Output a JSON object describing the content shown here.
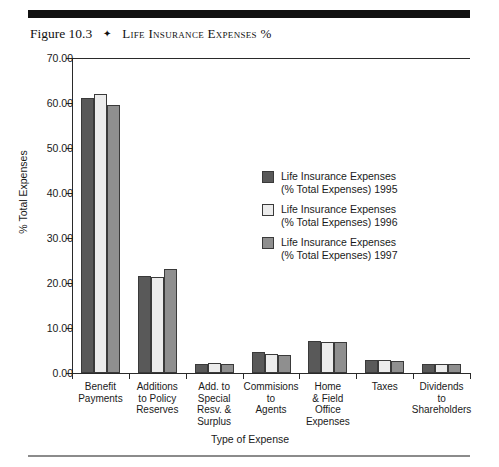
{
  "caption": {
    "figure_number": "Figure 10.3",
    "separator": "✦",
    "title": "Life Insurance Expenses %"
  },
  "colors": {
    "series_1995": "#595959",
    "series_1996": "#ececec",
    "series_1997": "#8f8f8f",
    "axis": "#2a2a2a",
    "rule_top": "#111111",
    "rule_bottom": "#8b8b8b"
  },
  "axis_title_x": "Type of Expense",
  "axis_title_y": "% Total Expenses",
  "y_tick_labels": [
    "70.00",
    "60.00",
    "50.00",
    "40.00",
    "30.00",
    "20.00",
    "10.00",
    "0.00"
  ],
  "legend": {
    "entries": [
      "Life Insurance Expenses\n(% Total Expenses) 1995",
      "Life Insurance Expenses\n(% Total Expenses) 1996",
      "Life Insurance Expenses\n(% Total Expenses) 1997"
    ]
  },
  "category_labels": [
    "Benefit\nPayments",
    "Additions\nto Policy\nReserves",
    "Add. to\nSpecial\nResv. &\nSurplus",
    "Commisions\nto\nAgents",
    "Home\n& Field\nOffice\nExpenses",
    "Taxes",
    "Dividends\nto\nShareholders"
  ],
  "chart_data": {
    "type": "bar",
    "title": "Life Insurance Expenses %",
    "xlabel": "Type of Expense",
    "ylabel": "% Total Expenses",
    "ylim": [
      0,
      70
    ],
    "yticks": [
      0,
      10,
      20,
      30,
      40,
      50,
      60,
      70
    ],
    "grid": false,
    "legend_position": "inside-center-right",
    "categories": [
      "Benefit Payments",
      "Additions to Policy Reserves",
      "Add. to Special Resv. & Surplus",
      "Commisions to Agents",
      "Home & Field Office Expenses",
      "Taxes",
      "Dividends to Shareholders"
    ],
    "series": [
      {
        "name": "Life Insurance Expenses (% Total Expenses) 1995",
        "color": "#595959",
        "values": [
          61.2,
          21.5,
          2.1,
          4.7,
          7.1,
          3.0,
          2.1
        ]
      },
      {
        "name": "Life Insurance Expenses (% Total Expenses) 1996",
        "color": "#ececec",
        "values": [
          62.1,
          21.3,
          2.2,
          4.3,
          7.0,
          2.9,
          2.0
        ]
      },
      {
        "name": "Life Insurance Expenses (% Total Expenses) 1997",
        "color": "#8f8f8f",
        "values": [
          59.5,
          23.1,
          2.1,
          4.1,
          6.9,
          2.7,
          2.0
        ]
      }
    ]
  }
}
